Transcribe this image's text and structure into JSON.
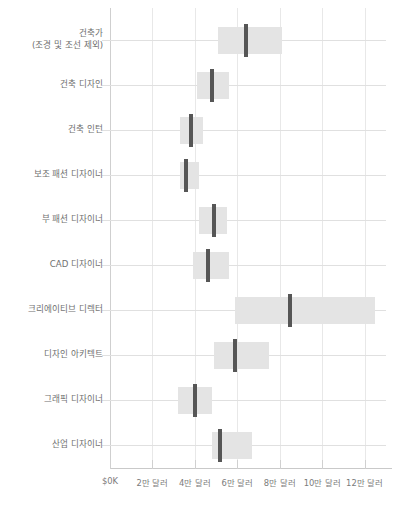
{
  "chart_data": {
    "type": "bar",
    "subtype": "horizontal-box-range",
    "title": "",
    "xlabel": "",
    "ylabel": "",
    "xlim": [
      0,
      130000
    ],
    "grid": true,
    "legend": null,
    "xticks": [
      {
        "value": 0,
        "label": "$0K"
      },
      {
        "value": 20000,
        "label": "2만 달러"
      },
      {
        "value": 40000,
        "label": "4만 달러"
      },
      {
        "value": 60000,
        "label": "6만 달러"
      },
      {
        "value": 80000,
        "label": "8만 달러"
      },
      {
        "value": 100000,
        "label": "10만 달러"
      },
      {
        "value": 120000,
        "label": "12만 달러"
      }
    ],
    "categories": [
      "건축가\n(조경 및 조선 제외)",
      "건축 디자인",
      "건축 인턴",
      "보조 패션 디자이너",
      "부 패션 디자이너",
      "CAD 디자이너",
      "크리에이티브 디렉터",
      "디자인 아키텍트",
      "그래픽 디자이너",
      "산업 디자이너"
    ],
    "series": [
      {
        "name": "low",
        "values": [
          51000,
          41000,
          33000,
          33000,
          42000,
          39000,
          59000,
          49000,
          32000,
          48000
        ]
      },
      {
        "name": "median",
        "values": [
          64000,
          48000,
          38000,
          36000,
          49000,
          46000,
          85000,
          59000,
          40000,
          52000
        ]
      },
      {
        "name": "high",
        "values": [
          81000,
          56000,
          44000,
          42000,
          55000,
          56000,
          125000,
          75000,
          48000,
          67000
        ]
      }
    ],
    "colors": {
      "box_fill": "#e4e4e4",
      "median_line": "#565656",
      "grid": "#e4e4e4",
      "axis": "#c9c9c9",
      "text": "#6f6f6f",
      "background": "#ffffff"
    }
  }
}
